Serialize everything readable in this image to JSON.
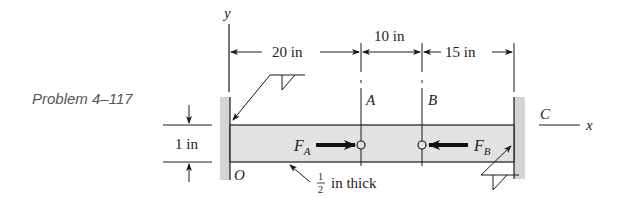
{
  "caption": "Problem 4–117",
  "axes": {
    "y_label": "y",
    "x_label": "x"
  },
  "dimensions": {
    "seg1": "20 in",
    "seg2": "10 in",
    "seg3": "15 in",
    "height": "1 in",
    "thickness_num": "1",
    "thickness_den": "2",
    "thickness_text": "in thick"
  },
  "points": {
    "origin": "O",
    "a": "A",
    "b": "B",
    "c": "C"
  },
  "forces": {
    "fa_main": "F",
    "fa_sub": "A",
    "fb_main": "F",
    "fb_sub": "B"
  },
  "colors": {
    "beam_fill": "#e2e2e2",
    "wall_fill": "#d4d4d4",
    "line": "#1a1a1a"
  }
}
